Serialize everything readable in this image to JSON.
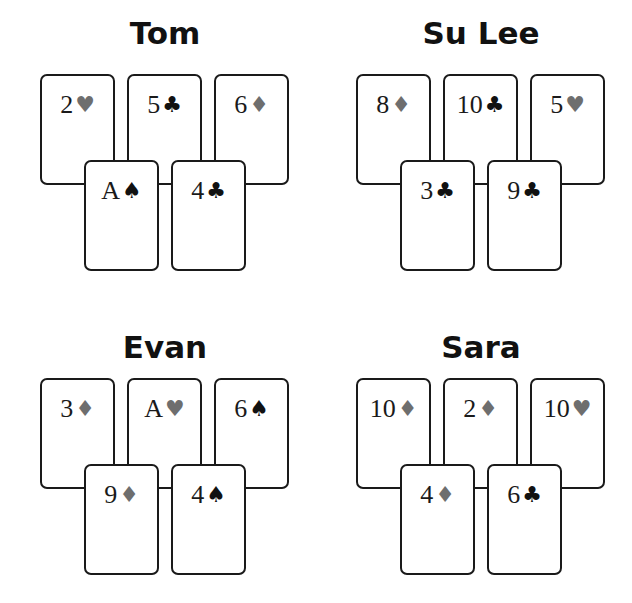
{
  "colors": {
    "card_border": "#1a1a1a",
    "red_suit_print": "#6e6e6e",
    "black_suit": "#111111",
    "background": "#ffffff"
  },
  "hands": [
    {
      "player": "Tom",
      "cards": [
        {
          "rank": "2",
          "suit": "hearts",
          "symbol": "♥",
          "color": "red"
        },
        {
          "rank": "5",
          "suit": "clubs",
          "symbol": "♣",
          "color": "black"
        },
        {
          "rank": "6",
          "suit": "diamonds",
          "symbol": "♦",
          "color": "red"
        },
        {
          "rank": "A",
          "suit": "spades",
          "symbol": "♠",
          "color": "black"
        },
        {
          "rank": "4",
          "suit": "clubs",
          "symbol": "♣",
          "color": "black"
        }
      ]
    },
    {
      "player": "Su Lee",
      "cards": [
        {
          "rank": "8",
          "suit": "diamonds",
          "symbol": "♦",
          "color": "red"
        },
        {
          "rank": "10",
          "suit": "clubs",
          "symbol": "♣",
          "color": "black"
        },
        {
          "rank": "5",
          "suit": "hearts",
          "symbol": "♥",
          "color": "red"
        },
        {
          "rank": "3",
          "suit": "clubs",
          "symbol": "♣",
          "color": "black"
        },
        {
          "rank": "9",
          "suit": "clubs",
          "symbol": "♣",
          "color": "black"
        }
      ]
    },
    {
      "player": "Evan",
      "cards": [
        {
          "rank": "3",
          "suit": "diamonds",
          "symbol": "♦",
          "color": "red"
        },
        {
          "rank": "A",
          "suit": "hearts",
          "symbol": "♥",
          "color": "red"
        },
        {
          "rank": "6",
          "suit": "spades",
          "symbol": "♠",
          "color": "black"
        },
        {
          "rank": "9",
          "suit": "diamonds",
          "symbol": "♦",
          "color": "red"
        },
        {
          "rank": "4",
          "suit": "spades",
          "symbol": "♠",
          "color": "black"
        }
      ]
    },
    {
      "player": "Sara",
      "cards": [
        {
          "rank": "10",
          "suit": "diamonds",
          "symbol": "♦",
          "color": "red"
        },
        {
          "rank": "2",
          "suit": "diamonds",
          "symbol": "♦",
          "color": "red"
        },
        {
          "rank": "10",
          "suit": "hearts",
          "symbol": "♥",
          "color": "red"
        },
        {
          "rank": "4",
          "suit": "diamonds",
          "symbol": "♦",
          "color": "red"
        },
        {
          "rank": "6",
          "suit": "clubs",
          "symbol": "♣",
          "color": "black"
        }
      ]
    }
  ]
}
